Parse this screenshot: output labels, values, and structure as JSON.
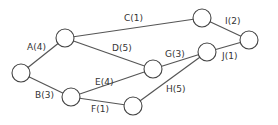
{
  "diagram": {
    "type": "activity-network",
    "nodes": [
      {
        "id": "n1",
        "x": 21,
        "y": 73
      },
      {
        "id": "n2",
        "x": 65,
        "y": 38
      },
      {
        "id": "n3",
        "x": 71,
        "y": 97
      },
      {
        "id": "n4",
        "x": 202,
        "y": 18
      },
      {
        "id": "n5",
        "x": 153,
        "y": 69
      },
      {
        "id": "n6",
        "x": 133,
        "y": 106
      },
      {
        "id": "n7",
        "x": 207,
        "y": 52
      },
      {
        "id": "n8",
        "x": 249,
        "y": 40
      }
    ],
    "edges": [
      {
        "from": "n1",
        "to": "n2",
        "label": "A(4)",
        "lx": 27,
        "ly": 43
      },
      {
        "from": "n1",
        "to": "n3",
        "label": "B(3)",
        "lx": 35,
        "ly": 91
      },
      {
        "from": "n2",
        "to": "n4",
        "label": "C(1)",
        "lx": 124,
        "ly": 14
      },
      {
        "from": "n2",
        "to": "n5",
        "label": "D(5)",
        "lx": 112,
        "ly": 44
      },
      {
        "from": "n3",
        "to": "n5",
        "label": "E(4)",
        "lx": 95,
        "ly": 78
      },
      {
        "from": "n3",
        "to": "n6",
        "label": "F(1)",
        "lx": 91,
        "ly": 105
      },
      {
        "from": "n5",
        "to": "n7",
        "label": "G(3)",
        "lx": 165,
        "ly": 50
      },
      {
        "from": "n6",
        "to": "n7",
        "label": "H(5)",
        "lx": 166,
        "ly": 85
      },
      {
        "from": "n4",
        "to": "n8",
        "label": "I(2)",
        "lx": 225,
        "ly": 17
      },
      {
        "from": "n7",
        "to": "n8",
        "label": "J(1)",
        "lx": 222,
        "ly": 52
      }
    ]
  }
}
